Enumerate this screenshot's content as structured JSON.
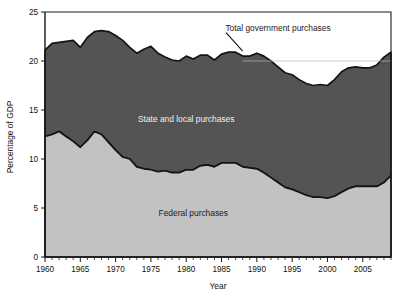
{
  "chart_data": {
    "type": "area",
    "title": "",
    "xlabel": "Year",
    "ylabel": "Percentage of GDP",
    "xlim": [
      1960,
      2009
    ],
    "ylim": [
      0,
      25
    ],
    "yticks": [
      0,
      5,
      10,
      15,
      20,
      25
    ],
    "xticks": [
      1960,
      1965,
      1970,
      1975,
      1980,
      1985,
      1990,
      1995,
      2000,
      2005
    ],
    "grid": false,
    "stacked": true,
    "legend_position": "inline-annotations",
    "annotations": [
      {
        "text": "Total government purchases",
        "x": 1993,
        "y": 23.1,
        "leader_to_x": 1988,
        "leader_to_y": 21.0
      },
      {
        "text": "State and local purchases",
        "x": 1980,
        "y": 13.8
      },
      {
        "text": "Federal purchases",
        "x": 1981,
        "y": 4.2
      }
    ],
    "x": [
      1960,
      1961,
      1962,
      1963,
      1964,
      1965,
      1966,
      1967,
      1968,
      1969,
      1970,
      1971,
      1972,
      1973,
      1974,
      1975,
      1976,
      1977,
      1978,
      1979,
      1980,
      1981,
      1982,
      1983,
      1984,
      1985,
      1986,
      1987,
      1988,
      1989,
      1990,
      1991,
      1992,
      1993,
      1994,
      1995,
      1996,
      1997,
      1998,
      1999,
      2000,
      2001,
      2002,
      2003,
      2004,
      2005,
      2006,
      2007,
      2008,
      2009
    ],
    "series": [
      {
        "name": "Federal purchases",
        "color": "#c2c2c2",
        "values": [
          12.3,
          12.5,
          12.8,
          12.3,
          11.8,
          11.2,
          11.9,
          12.8,
          12.5,
          11.7,
          10.9,
          10.2,
          10.0,
          9.2,
          9.0,
          8.9,
          8.7,
          8.8,
          8.6,
          8.6,
          8.9,
          8.9,
          9.3,
          9.4,
          9.2,
          9.6,
          9.6,
          9.6,
          9.2,
          9.1,
          9.0,
          8.6,
          8.1,
          7.6,
          7.1,
          6.9,
          6.6,
          6.3,
          6.1,
          6.1,
          6.0,
          6.2,
          6.6,
          7.0,
          7.2,
          7.2,
          7.2,
          7.2,
          7.6,
          8.3
        ],
        "label_color": "#1b1b1b"
      },
      {
        "name": "State and local purchases",
        "color": "#545454",
        "values": [
          8.8,
          9.3,
          9.1,
          9.7,
          10.3,
          10.2,
          10.5,
          10.2,
          10.6,
          11.3,
          11.7,
          11.9,
          11.4,
          11.6,
          12.2,
          12.6,
          12.1,
          11.6,
          11.5,
          11.4,
          11.6,
          11.3,
          11.3,
          11.2,
          10.9,
          11.1,
          11.3,
          11.3,
          11.3,
          11.4,
          11.8,
          11.9,
          11.9,
          11.8,
          11.7,
          11.7,
          11.5,
          11.4,
          11.4,
          11.5,
          11.5,
          11.9,
          12.3,
          12.3,
          12.2,
          12.1,
          12.1,
          12.4,
          12.8,
          12.6
        ],
        "label_color": "#efefef"
      }
    ],
    "total": {
      "name": "Total government purchases",
      "values": [
        21.1,
        21.8,
        21.9,
        22.0,
        22.1,
        21.4,
        22.4,
        23.0,
        23.1,
        23.0,
        22.6,
        22.1,
        21.4,
        20.8,
        21.2,
        21.5,
        20.8,
        20.4,
        20.1,
        20.0,
        20.5,
        20.2,
        20.6,
        20.6,
        20.1,
        20.7,
        20.9,
        20.9,
        20.5,
        20.5,
        20.8,
        20.5,
        20.0,
        19.4,
        18.8,
        18.6,
        18.1,
        17.7,
        17.5,
        17.6,
        17.5,
        18.1,
        18.9,
        19.3,
        19.4,
        19.3,
        19.3,
        19.6,
        20.4,
        20.9
      ]
    }
  },
  "axes": {
    "y_title": "Percentage of GDP",
    "x_title": "Year",
    "y_tick_labels": [
      "0",
      "5",
      "10",
      "15",
      "20",
      "25"
    ],
    "x_tick_labels": [
      "1960",
      "1965",
      "1970",
      "1975",
      "1980",
      "1985",
      "1990",
      "1995",
      "2000",
      "2005"
    ]
  },
  "labels": {
    "total": "Total government purchases",
    "state_local": "State and local purchases",
    "federal": "Federal purchases"
  },
  "colors": {
    "upper_band": "#545454",
    "lower_band": "#c2c2c2",
    "outline": "#141414",
    "text": "#15100c",
    "background": "#ffffff"
  }
}
